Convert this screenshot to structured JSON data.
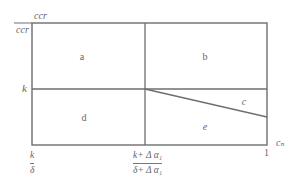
{
  "diagram": {
    "top_label": {
      "numerator": "ccr",
      "denominator": "ccr"
    },
    "y_axis_label": "k",
    "x_axis": {
      "left_tick": {
        "numerator": "k",
        "denominator": "δ"
      },
      "middle_tick": {
        "numerator": "k+ Δ α₁",
        "denominator": "δ+ Δ α₁"
      },
      "right_tick": "1",
      "axis_label": "cₙ"
    },
    "regions": {
      "a": "a",
      "b": "b",
      "c": "c",
      "d": "d",
      "e": "e"
    },
    "colors": {
      "line": "#6e6e6e",
      "text": "#666666"
    }
  }
}
